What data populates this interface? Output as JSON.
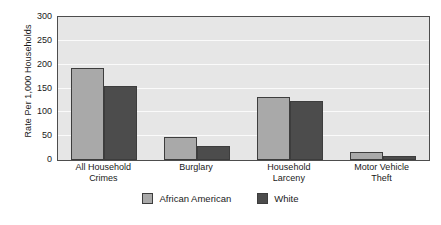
{
  "chart_data": {
    "type": "bar",
    "title": "",
    "xlabel": "",
    "ylabel": "Rate Per 1,000 Households",
    "ylim": [
      0,
      300
    ],
    "yticks": [
      0,
      50,
      100,
      150,
      200,
      250,
      300
    ],
    "ytick_labels": [
      "0",
      "50",
      "100",
      "150",
      "200",
      "250",
      "300"
    ],
    "grid": true,
    "legend_position": "bottom-center",
    "categories": [
      "All Household\nCrimes",
      "Burglary",
      "Household\nLarceny",
      "Motor Vehicle\nTheft"
    ],
    "category_lines": [
      [
        "All Household",
        "Crimes"
      ],
      [
        "Burglary",
        ""
      ],
      [
        "Household",
        "Larceny"
      ],
      [
        "Motor Vehicle",
        "Theft"
      ]
    ],
    "series": [
      {
        "name": "African American",
        "color": "#a9a9a9",
        "values": [
          193,
          48,
          132,
          17
        ]
      },
      {
        "name": "White",
        "color": "#4c4c4c",
        "values": [
          155,
          29,
          124,
          9
        ]
      }
    ],
    "colors": {
      "plot_background": "#e6e6e6",
      "gridline": "#fafafa",
      "axis_border": "#4d4d4d",
      "bar_border": "#3d3d3d",
      "text": "#1a1a1a",
      "page_background": "#ffffff"
    }
  }
}
